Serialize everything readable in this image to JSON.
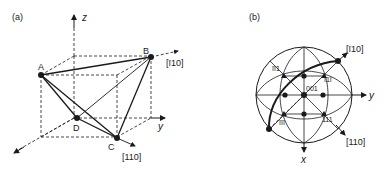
{
  "panel_a": {
    "label": "(a)",
    "axes": {
      "z": "z",
      "y": "y"
    },
    "points": {
      "A": "A",
      "B": "B",
      "C": "C",
      "D": "D"
    },
    "directions": {
      "b_dir": "[ī10]",
      "c_dir": "[110]"
    }
  },
  "panel_b": {
    "label": "(b)",
    "axes": {
      "x": "x",
      "y": "y"
    },
    "poles": {
      "center": "001",
      "upper_left": "īī1",
      "upper_right": "ī1ī",
      "lower_left": "īīī",
      "lower_right": "111"
    },
    "directions": {
      "top_right": "[ī10]",
      "bottom_right": "[110]"
    }
  },
  "colors": {
    "ink": "#1a1a1a",
    "background": "#ffffff"
  }
}
